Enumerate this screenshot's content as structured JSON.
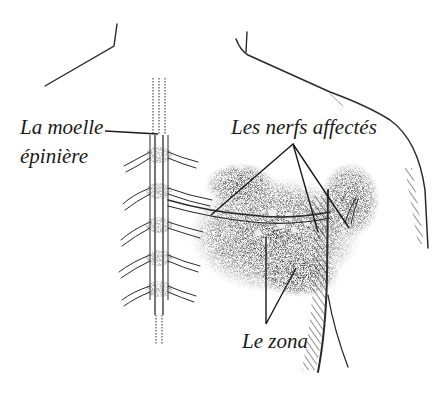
{
  "figure": {
    "colors": {
      "ink": "#1a1a1a",
      "stipple": "#555555",
      "background": "#ffffff"
    }
  },
  "labels": {
    "spinal_cord_line1": "La moelle",
    "spinal_cord_line2": "épinière",
    "affected_nerves": "Les nerfs affectés",
    "shingles": "Le zona"
  }
}
